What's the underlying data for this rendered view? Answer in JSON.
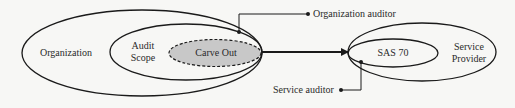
{
  "diagram": {
    "nodes": {
      "organization": {
        "label": "Organization"
      },
      "audit_scope": {
        "label_line1": "Audit",
        "label_line2": "Scope"
      },
      "carve_out": {
        "label": "Carve Out"
      },
      "sas70": {
        "label": "SAS 70"
      },
      "service_provider": {
        "label_line1": "Service",
        "label_line2": "Provider"
      }
    },
    "callouts": {
      "organization_auditor": {
        "label": "Organization auditor"
      },
      "service_auditor": {
        "label": "Service auditor"
      }
    },
    "colors": {
      "stroke": "#1a1a1a",
      "carve_out_fill": "#c8c8c8",
      "background": "#f7f7f5"
    }
  }
}
